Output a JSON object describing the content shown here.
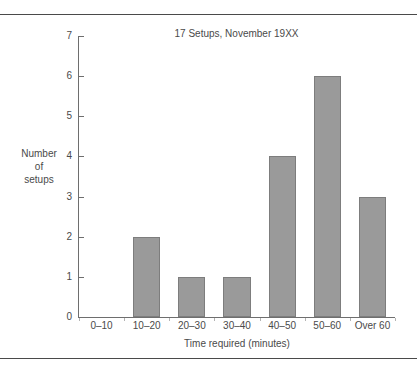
{
  "chart_data": {
    "type": "bar",
    "title": "17 Setups, November 19XX",
    "xlabel": "Time required (minutes)",
    "ylabel": "Number of setups",
    "ylabel_lines": [
      "Number",
      "of",
      "setups"
    ],
    "categories": [
      "0–10",
      "10–20",
      "20–30",
      "30–40",
      "40–50",
      "50–60",
      "Over 60"
    ],
    "values": [
      0,
      2,
      1,
      1,
      4,
      6,
      3
    ],
    "ylim": [
      0,
      7
    ],
    "ytick_labels": [
      "0",
      "1",
      "2",
      "3",
      "4",
      "5",
      "6",
      "7"
    ],
    "ytick_values": [
      0,
      1,
      2,
      3,
      4,
      5,
      6,
      7
    ],
    "grid": false,
    "legend": null,
    "bar_color": "#9a9a9a",
    "bar_border_color": "#7d7d7d",
    "axis_color": "#6e6e6e",
    "background": "#ffffff"
  }
}
